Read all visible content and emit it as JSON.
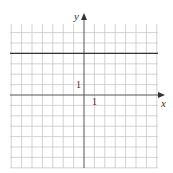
{
  "chart_data": {
    "type": "line",
    "title": "",
    "xlabel": "x",
    "ylabel": "y",
    "xlim": [
      -7,
      7
    ],
    "ylim": [
      -7,
      7
    ],
    "grid": true,
    "tick_labels": {
      "x": [
        "1"
      ],
      "y": [
        "1"
      ]
    },
    "series": [
      {
        "name": "y = 4",
        "x": [
          -7,
          7
        ],
        "y": [
          4,
          4
        ]
      }
    ]
  },
  "labels": {
    "x_axis": "x",
    "y_axis": "y",
    "x_tick": "1",
    "y_tick": "1"
  },
  "colors": {
    "grid": "#c8c8c8",
    "axis": "#555555",
    "line": "#333333"
  }
}
